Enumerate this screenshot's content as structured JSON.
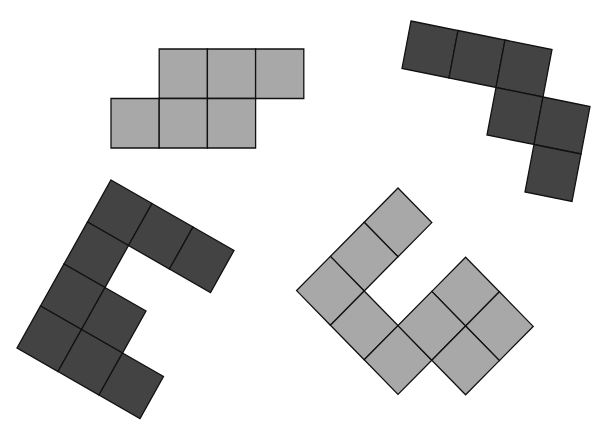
{
  "figure": {
    "width": 610,
    "height": 447,
    "background": "#ffffff",
    "stroke": "#111111",
    "shapes": [
      {
        "name": "light-polyomino-top",
        "fill": "#a8a8a8",
        "origin": [
          111,
          98.5
        ],
        "u": [
          48.2,
          0
        ],
        "v": [
          0,
          49.5
        ],
        "cells": [
          [
            1,
            -1
          ],
          [
            2,
            -1
          ],
          [
            3,
            -1
          ],
          [
            0,
            0
          ],
          [
            1,
            0
          ],
          [
            2,
            0
          ]
        ]
      },
      {
        "name": "dark-polyomino-top-right",
        "fill": "#434343",
        "origin": [
          411,
          21
        ],
        "u": [
          47,
          9.5
        ],
        "v": [
          -9,
          47.5
        ],
        "cells": [
          [
            0,
            0
          ],
          [
            1,
            0
          ],
          [
            2,
            0
          ],
          [
            2,
            1
          ],
          [
            3,
            1
          ],
          [
            3,
            2
          ]
        ]
      },
      {
        "name": "dark-polyomino-bottom-left",
        "fill": "#434343",
        "origin": [
          111,
          180
        ],
        "u": [
          41,
          23.5
        ],
        "v": [
          -23.5,
          42
        ],
        "cells": [
          [
            0,
            0
          ],
          [
            1,
            0
          ],
          [
            2,
            0
          ],
          [
            0,
            1
          ],
          [
            0,
            2
          ],
          [
            1,
            2
          ],
          [
            0,
            3
          ],
          [
            1,
            3
          ],
          [
            2,
            3
          ]
        ]
      },
      {
        "name": "light-polyomino-bottom-right",
        "fill": "#a8a8a8",
        "origin": [
          398,
          188
        ],
        "u": [
          33.8,
          34.6
        ],
        "v": [
          -33.8,
          34.2
        ],
        "cells": [
          [
            0,
            0
          ],
          [
            0,
            1
          ],
          [
            0,
            2
          ],
          [
            1,
            2
          ],
          [
            2,
            2
          ],
          [
            2,
            0
          ],
          [
            3,
            0
          ],
          [
            2,
            1
          ],
          [
            3,
            1
          ]
        ]
      }
    ]
  }
}
